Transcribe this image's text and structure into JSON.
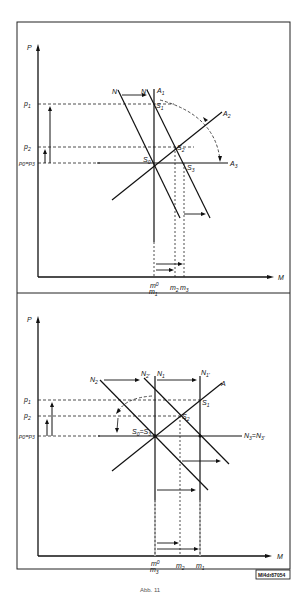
{
  "figure": {
    "caption": "Abb. 11",
    "image_tag": "MI4dr87054"
  },
  "top_panel": {
    "y_axis_label": "P",
    "x_axis_label": "M",
    "y_ticks": [
      "p1",
      "p2",
      "p0=p3"
    ],
    "x_ticks": [
      "m0 = m1",
      "m2",
      "m3"
    ],
    "curves": [
      "N",
      "N'",
      "A1",
      "A2",
      "A3"
    ],
    "points": [
      "S0",
      "S1",
      "S2",
      "S3"
    ]
  },
  "bottom_panel": {
    "y_axis_label": "P",
    "x_axis_label": "M",
    "y_ticks": [
      "p1",
      "p2",
      "p0=p3"
    ],
    "x_ticks": [
      "m0 = m3",
      "m2",
      "m1"
    ],
    "curves": [
      "N2",
      "N2'",
      "N1",
      "N1'",
      "A",
      "N3=N3'"
    ],
    "points": [
      "S0=S3",
      "S1",
      "S2"
    ]
  },
  "labels": {
    "t_P": "P",
    "t_M": "M",
    "t_p1": "p",
    "t_p1s": "1",
    "t_p2": "p",
    "t_p2s": "2",
    "t_p0": "p",
    "t_p0s": "0",
    "t_eq": "=p",
    "t_p3s": "3",
    "t_N": "N",
    "t_Np": "N'",
    "t_A1": "A",
    "t_A1s": "1",
    "t_A2": "A",
    "t_A2s": "2",
    "t_A3": "A",
    "t_A3s": "3",
    "t_S0": "S",
    "t_S0s": "0",
    "t_S1": "S",
    "t_S1s": "1",
    "t_S2": "S",
    "t_S2s": "2",
    "t_S3": "S",
    "t_S3s": "3",
    "t_m0": "m",
    "t_m0s": "0",
    "t_m1": "m",
    "t_m1s": "1",
    "t_m2": "m",
    "t_m2s": "2",
    "t_m3": "m",
    "t_m3s": "3",
    "b_P": "P",
    "b_M": "M",
    "b_N2": "N",
    "b_N2s": "2",
    "b_N2p": "N",
    "b_N2ps": "2'",
    "b_N1": "N",
    "b_N1s": "1",
    "b_N1p": "N",
    "b_N1ps": "1'",
    "b_A": "A",
    "b_N3": "N",
    "b_N3s": "3",
    "b_N3eq": "=N",
    "b_N3ps": "3'",
    "b_S0": "S",
    "b_S0s": "0",
    "b_S0eq": "=S",
    "b_S3s": "3",
    "b_S1": "S",
    "b_S1s": "1",
    "b_S2": "S",
    "b_S2s": "2"
  }
}
